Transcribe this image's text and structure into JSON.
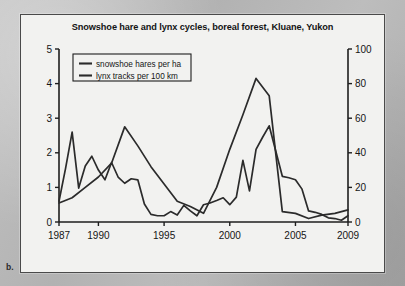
{
  "figure": {
    "panel_letter": "b.",
    "title": "Snowshoe hare and lynx cycles, boreal forest, Kluane, Yukon"
  },
  "chart_data": {
    "type": "line",
    "title": "Snowshoe hare and lynx cycles, boreal forest, Kluane, Yukon",
    "xlabel": "",
    "ylabel": "snowshoe hares per ha",
    "ylabel_right": "lynx tracks per 100 km",
    "xlim": [
      1987,
      2009
    ],
    "ylim": [
      0,
      5
    ],
    "ylim_right": [
      0,
      100
    ],
    "grid": false,
    "legend_position": "top-left",
    "x_ticks": [
      1987,
      1990,
      1995,
      2000,
      2005,
      2009
    ],
    "x_tick_labels": [
      "1987",
      "1990",
      "1995",
      "2000",
      "2005",
      "2009"
    ],
    "y_ticks_left": [
      0,
      1,
      2,
      3,
      4,
      5
    ],
    "y_tick_labels_left": [
      "0",
      "1",
      "2",
      "3",
      "4",
      "5"
    ],
    "y_ticks_right": [
      0,
      20,
      40,
      60,
      80,
      100
    ],
    "y_tick_labels_right": [
      "0",
      "20",
      "40",
      "60",
      "80",
      "100"
    ],
    "series": [
      {
        "name": "snowshoe hares per ha",
        "axis": "left",
        "units": "hares per ha",
        "color": "#2b2b2b",
        "x": [
          1987.0,
          1987.5,
          1988.0,
          1988.5,
          1989.0,
          1989.5,
          1990.0,
          1990.5,
          1991.0,
          1991.5,
          1992.0,
          1992.5,
          1993.0,
          1993.5,
          1994.0,
          1994.5,
          1995.0,
          1995.5,
          1996.0,
          1996.5,
          1997.0,
          1997.5,
          1998.0,
          1998.5,
          1999.0,
          1999.5,
          2000.0,
          2000.5,
          2001.0,
          2001.5,
          2002.0,
          2002.5,
          2003.0,
          2003.5,
          2004.0,
          2004.5,
          2005.0,
          2005.5,
          2006.0,
          2006.5,
          2007.0,
          2007.5,
          2008.0,
          2008.5,
          2009.0
        ],
        "y": [
          0.6,
          1.55,
          2.6,
          0.98,
          1.62,
          1.9,
          1.5,
          1.22,
          1.72,
          1.3,
          1.12,
          1.25,
          1.22,
          0.52,
          0.22,
          0.18,
          0.18,
          0.3,
          0.2,
          0.48,
          0.32,
          0.18,
          0.5,
          0.55,
          0.62,
          0.7,
          0.5,
          0.72,
          1.78,
          0.9,
          2.1,
          2.45,
          2.78,
          2.05,
          1.32,
          1.28,
          1.22,
          0.95,
          0.32,
          0.28,
          0.22,
          0.12,
          0.1,
          0.05,
          0.18
        ]
      },
      {
        "name": "lynx tracks per 100 km",
        "axis": "right",
        "units": "tracks per 100 km",
        "color": "#2b2b2b",
        "x": [
          1987,
          1988,
          1989,
          1990,
          1991,
          1992,
          1993,
          1994,
          1995,
          1996,
          1997,
          1998,
          1999,
          2000,
          2001,
          2002,
          2003,
          2004,
          2005,
          2006,
          2007,
          2008,
          2009
        ],
        "y": [
          11,
          14,
          20,
          26,
          34,
          55,
          44,
          32,
          22,
          12,
          9,
          5,
          20,
          42,
          62,
          83,
          73,
          6,
          5,
          2,
          4,
          5,
          7
        ]
      }
    ],
    "annotations": []
  },
  "legend": {
    "entries": [
      {
        "label": "snowshoe hares per ha"
      },
      {
        "label": "lynx tracks per 100 km"
      }
    ]
  },
  "colors": {
    "line": "#2b2b2b",
    "axis": "#1e1e1e",
    "panel_bg": "#f2f2f0",
    "page_bg": "#b9b9b9"
  }
}
